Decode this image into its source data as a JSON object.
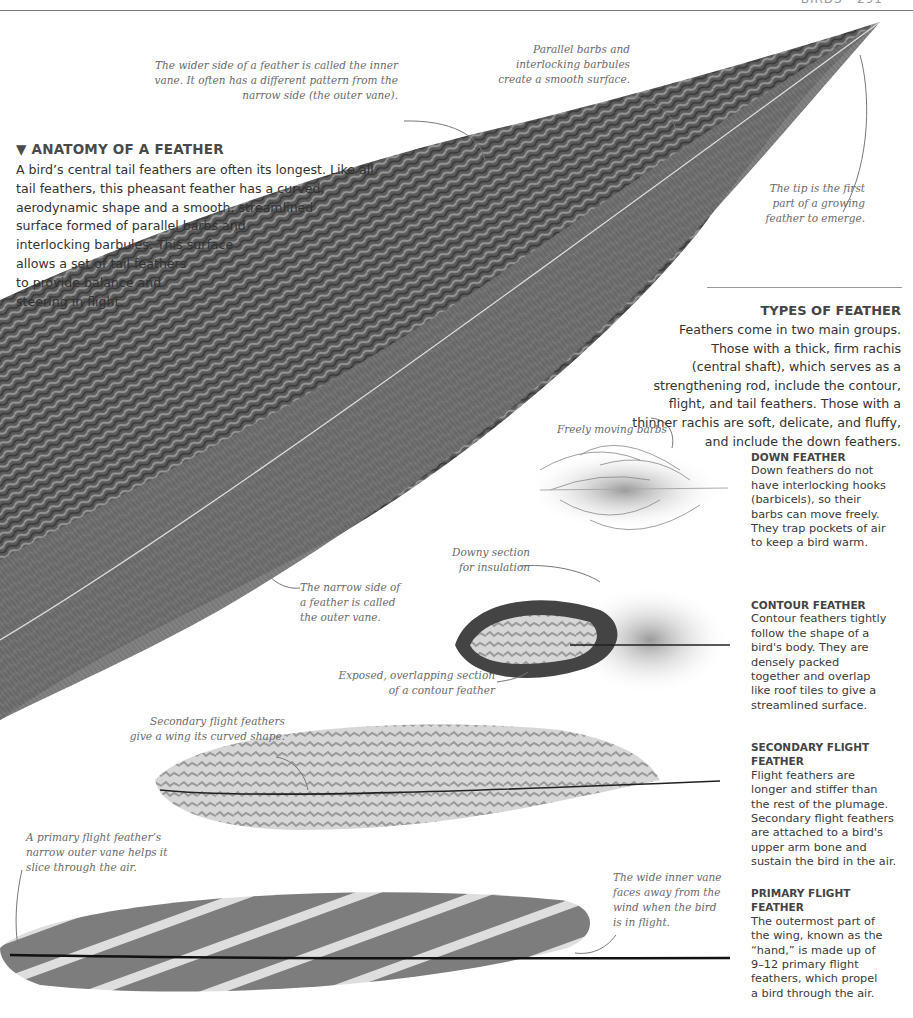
{
  "page": {
    "header_fragment": "BIRDS · 291"
  },
  "intro": {
    "title_marker": "▼",
    "title": "ANATOMY OF A FEATHER",
    "body_lines": [
      "A bird’s central tail feathers are often its longest. Like all",
      "tail feathers, this pheasant feather has a curved,",
      "aerodynamic shape and a smooth, streamlined",
      "surface formed of parallel barbs and",
      "interlocking barbules. This surface",
      "allows a set of tail feathers",
      "to provide balance and",
      "steering in flight."
    ]
  },
  "types": {
    "title": "TYPES OF FEATHER",
    "body_lines": [
      "Feathers come in two main groups.",
      "Those with a thick, firm rachis",
      "(central shaft), which serves as a",
      "strengthening rod, include the contour,",
      "flight, and tail feathers. Those with a",
      "thinner rachis are soft, delicate, and fluffy,",
      "and include the down feathers."
    ]
  },
  "side_panels": [
    {
      "title_lines": [
        "DOWN FEATHER"
      ],
      "body_lines": [
        "Down feathers do not",
        "have interlocking hooks",
        "(barbicels), so their",
        "barbs can move freely.",
        "They trap pockets of air",
        "to keep a bird warm."
      ]
    },
    {
      "title_lines": [
        "CONTOUR FEATHER"
      ],
      "body_lines": [
        "Contour feathers tightly",
        "follow the shape of a",
        "bird's body. They are",
        "densely packed",
        "together and overlap",
        "like roof tiles to give a",
        "streamlined surface."
      ]
    },
    {
      "title_lines": [
        "SECONDARY FLIGHT",
        "FEATHER"
      ],
      "body_lines": [
        "Flight feathers are",
        "longer and stiffer than",
        "the rest of the plumage.",
        "Secondary flight feathers",
        "are attached to a bird's",
        "upper arm bone and",
        "sustain the bird in the air."
      ]
    },
    {
      "title_lines": [
        "PRIMARY FLIGHT",
        "FEATHER"
      ],
      "body_lines": [
        "The outermost part of",
        "the wing, known as the",
        "“hand,” is made up of",
        "9–12 primary flight",
        "feathers, which propel",
        "a bird through the air."
      ]
    }
  ],
  "annotations": {
    "inner_vane": [
      "The wider side of a feather is called the inner",
      "vane. It often has a different pattern from the",
      "narrow side (the outer vane)."
    ],
    "barbs": [
      "Parallel barbs and",
      "interlocking barbules",
      "create a smooth surface."
    ],
    "tip": [
      "The tip is the first",
      "part of a growing",
      "feather to emerge."
    ],
    "outer_vane": [
      "The narrow side of",
      "a feather is called",
      "the outer vane."
    ],
    "freely_moving": [
      "Freely moving barbs"
    ],
    "downy": [
      "Downy section",
      "for insulation"
    ],
    "exposed": [
      "Exposed, overlapping section",
      "of a contour feather"
    ],
    "secondary": [
      "Secondary flight feathers",
      "give a wing its curved shape."
    ],
    "primary": [
      "A primary flight feather’s",
      "narrow outer vane helps it",
      "slice through the air."
    ],
    "wide_inner": [
      "The wide inner vane",
      "faces away from the",
      "wind when the bird",
      "is in flight."
    ]
  },
  "colors": {
    "text": "#333333",
    "annotation": "#6a6a6a",
    "feather_dark": "#3c3c3c",
    "feather_mid": "#7a7a7a",
    "feather_light": "#c8c8c8"
  }
}
